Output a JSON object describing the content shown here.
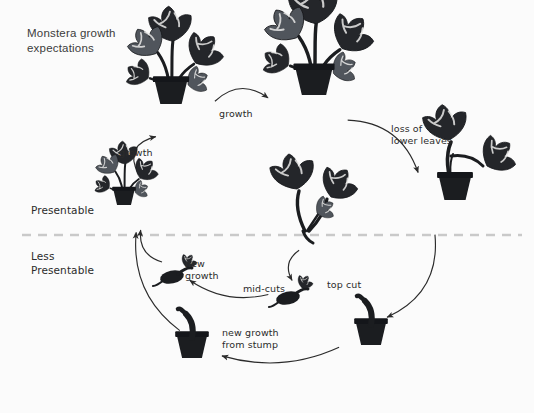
{
  "page": {
    "title_text": "Monstera growth\nexpectations",
    "background_color": "#fbfbfb",
    "ink_color": "#2b2b2b",
    "divider_color": "#c9c9c9"
  },
  "divider": {
    "name": "presentability-divider",
    "style": "dashed",
    "y": 235
  },
  "zones": [
    {
      "id": "presentable",
      "label": "Presentable",
      "x": 31,
      "y": 203
    },
    {
      "id": "less-presentable",
      "label": "Less\nPresentable",
      "x": 31,
      "y": 249
    }
  ],
  "edge_labels": [
    {
      "id": "growth-left",
      "label": "growth",
      "x": 119,
      "y": 147
    },
    {
      "id": "growth-top",
      "label": "growth",
      "x": 219,
      "y": 108
    },
    {
      "id": "loss",
      "label": "loss of\nlower leaves",
      "x": 391,
      "y": 123
    },
    {
      "id": "top-cut",
      "label": "top cut",
      "x": 327,
      "y": 279
    },
    {
      "id": "mid-cuts",
      "label": "mid-cuts",
      "x": 243,
      "y": 283
    },
    {
      "id": "new-growth",
      "label": "new\ngrowth",
      "x": 185,
      "y": 258
    },
    {
      "id": "stump-growth",
      "label": "new growth\nfrom stump",
      "x": 222,
      "y": 327
    }
  ],
  "nodes": [
    {
      "id": "young-plant",
      "name": "monstera-young-plant",
      "x": 124,
      "y": 205,
      "scale": 0.62,
      "kind": "potted-leafy"
    },
    {
      "id": "medium-plant",
      "name": "monstera-medium-plant",
      "x": 171,
      "y": 104,
      "scale": 0.95,
      "kind": "potted-leafy"
    },
    {
      "id": "mature-plant",
      "name": "monstera-mature-plant",
      "x": 314,
      "y": 95,
      "scale": 1.08,
      "kind": "potted-leafy"
    },
    {
      "id": "leggy-plant",
      "name": "monstera-leggy-plant",
      "x": 455,
      "y": 200,
      "scale": 1.0,
      "kind": "leggy"
    },
    {
      "id": "cut-tops",
      "name": "monstera-top-cuttings",
      "x": 305,
      "y": 225,
      "scale": 1.0,
      "kind": "cuttings"
    },
    {
      "id": "stump-pot",
      "name": "monstera-stump-in-pot",
      "x": 371,
      "y": 345,
      "scale": 1.0,
      "kind": "stump"
    },
    {
      "id": "mid-cutting",
      "name": "monstera-mid-cutting",
      "x": 288,
      "y": 298,
      "scale": 1.0,
      "kind": "node-cutting"
    },
    {
      "id": "rooted-cutting",
      "name": "monstera-rooted-cutting",
      "x": 172,
      "y": 277,
      "scale": 1.0,
      "kind": "node-cutting"
    },
    {
      "id": "resprout-pot",
      "name": "monstera-resprouting-stump",
      "x": 192,
      "y": 358,
      "scale": 1.0,
      "kind": "stump"
    }
  ],
  "arrows": [
    {
      "id": "a-young-to-medium",
      "from": "young-plant",
      "to": "medium-plant"
    },
    {
      "id": "a-medium-to-mature",
      "from": "medium-plant",
      "to": "mature-plant"
    },
    {
      "id": "a-mature-to-leggy",
      "from": "mature-plant",
      "to": "leggy-plant"
    },
    {
      "id": "a-leggy-to-stump",
      "from": "leggy-plant",
      "to": "stump-pot"
    },
    {
      "id": "a-stump-to-resprout",
      "from": "stump-pot",
      "to": "resprout-pot"
    },
    {
      "id": "a-resprout-to-young",
      "from": "resprout-pot",
      "to": "young-plant"
    },
    {
      "id": "a-mid-to-rooted",
      "from": "mid-cutting",
      "to": "rooted-cutting"
    },
    {
      "id": "a-rooted-to-young",
      "from": "rooted-cutting",
      "to": "young-plant"
    },
    {
      "id": "a-cuttings-to-mid",
      "from": "cut-tops",
      "to": "mid-cutting"
    }
  ]
}
